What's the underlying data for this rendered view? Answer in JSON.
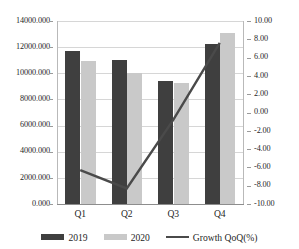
{
  "chart_data": {
    "type": "bar",
    "title": "",
    "subtitle": "",
    "xlabel": "",
    "ylabel": "",
    "categories": [
      "Q1",
      "Q2",
      "Q3",
      "Q4"
    ],
    "series": [
      {
        "name": "2019",
        "type": "bar",
        "axis": "left",
        "color": "#3f3f3f",
        "values": [
          11700.0,
          11000.0,
          9430.0,
          12230.0
        ]
      },
      {
        "name": "2020",
        "type": "bar",
        "axis": "left",
        "color": "#c9c9c9",
        "values": [
          10950.0,
          10030.0,
          9280.0,
          13100.0
        ]
      },
      {
        "name": "Growth QoQ(%)",
        "type": "line",
        "axis": "right",
        "color": "#4a4a4a",
        "values": [
          -6.3,
          -8.3,
          -0.8,
          7.6
        ]
      }
    ],
    "axes": {
      "left": {
        "min": 0.0,
        "max": 14000.0,
        "step": 2000.0,
        "ticks": [
          "0.000",
          "2000.000",
          "4000.000",
          "6000.000",
          "8000.000",
          "10000.000",
          "12000.000",
          "14000.000"
        ]
      },
      "right": {
        "min": -10.0,
        "max": 10.0,
        "step": 2.0,
        "ticks": [
          "-10.00",
          "-8.00",
          "-6.00",
          "-4.00",
          "-2.00",
          "0.00",
          "2.00",
          "4.00",
          "6.00",
          "8.00",
          "10.00"
        ]
      }
    },
    "grid": true,
    "legend_position": "bottom",
    "legend": [
      "2019",
      "2020",
      "Growth QoQ(%)"
    ]
  }
}
